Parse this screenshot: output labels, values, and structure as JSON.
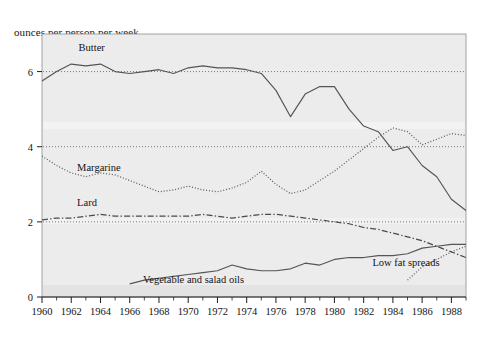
{
  "chart_data": {
    "type": "line",
    "title": "",
    "ylabel": "ounces per person per week",
    "xlabel": "",
    "ylim": [
      0,
      7
    ],
    "xlim": [
      1960,
      1989
    ],
    "yticks": [
      "0",
      "2",
      "4",
      "6"
    ],
    "ytick_values": [
      0,
      2,
      4,
      6
    ],
    "gridlines": [
      2,
      4,
      6
    ],
    "grid": "dotted horizontal gridlines at 2, 4 and 6",
    "legend": "inline labels placed next to each curve",
    "x": [
      1960,
      1961,
      1962,
      1963,
      1964,
      1965,
      1966,
      1967,
      1968,
      1969,
      1970,
      1971,
      1972,
      1973,
      1974,
      1975,
      1976,
      1977,
      1978,
      1979,
      1980,
      1981,
      1982,
      1983,
      1984,
      1985,
      1986,
      1987,
      1988,
      1989
    ],
    "xticks": [
      "1960",
      "1962",
      "1964",
      "1966",
      "1968",
      "1970",
      "1972",
      "1974",
      "1976",
      "1978",
      "1980",
      "1982",
      "1984",
      "1986",
      "1988"
    ],
    "xtick_values": [
      1960,
      1962,
      1964,
      1966,
      1968,
      1970,
      1972,
      1974,
      1976,
      1978,
      1980,
      1982,
      1984,
      1986,
      1988
    ],
    "series": [
      {
        "name": "Butter",
        "label": "Butter",
        "style": "solid",
        "color": "#555555",
        "label_x": 1962.5,
        "label_y": 6.55,
        "values": [
          5.75,
          6.0,
          6.2,
          6.15,
          6.2,
          6.0,
          5.95,
          6.0,
          6.05,
          5.95,
          6.1,
          6.15,
          6.1,
          6.1,
          6.05,
          5.95,
          5.5,
          4.8,
          5.4,
          5.6,
          5.6,
          5.0,
          4.55,
          4.4,
          3.9,
          4.0,
          3.5,
          3.2,
          2.6,
          2.3
        ]
      },
      {
        "name": "Margarine",
        "label": "Margarine",
        "style": "dotted",
        "color": "#5a5a5a",
        "label_x": 1962.4,
        "label_y": 3.35,
        "values": [
          3.75,
          3.5,
          3.3,
          3.2,
          3.3,
          3.25,
          3.1,
          2.95,
          2.8,
          2.85,
          2.95,
          2.85,
          2.8,
          2.9,
          3.05,
          3.35,
          3.0,
          2.75,
          2.85,
          3.1,
          3.35,
          3.65,
          3.95,
          4.25,
          4.5,
          4.4,
          4.05,
          4.2,
          4.35,
          4.3
        ]
      },
      {
        "name": "Lard",
        "label": "Lard",
        "style": "dashdot",
        "color": "#4a4a4a",
        "label_x": 1962.4,
        "label_y": 2.42,
        "values": [
          2.05,
          2.1,
          2.1,
          2.15,
          2.2,
          2.15,
          2.15,
          2.15,
          2.15,
          2.15,
          2.15,
          2.2,
          2.15,
          2.1,
          2.15,
          2.2,
          2.2,
          2.15,
          2.1,
          2.05,
          2.0,
          1.95,
          1.85,
          1.8,
          1.7,
          1.6,
          1.5,
          1.35,
          1.2,
          1.05
        ]
      },
      {
        "name": "Vegetable and salad oils",
        "label": "Vegetable and salad oils",
        "style": "solid",
        "color": "#555555",
        "label_x": 1966.9,
        "label_y": 0.38,
        "values": [
          null,
          null,
          null,
          null,
          null,
          null,
          0.35,
          0.45,
          0.5,
          0.55,
          0.6,
          0.65,
          0.7,
          0.85,
          0.75,
          0.7,
          0.7,
          0.75,
          0.9,
          0.85,
          1.0,
          1.05,
          1.05,
          1.1,
          1.1,
          1.15,
          1.3,
          1.35,
          1.4,
          1.4
        ]
      },
      {
        "name": "Low fat spreads",
        "label": "Low fat spreads",
        "style": "dotted",
        "color": "#5a5a5a",
        "label_x": 1982.6,
        "label_y": 0.82,
        "values": [
          null,
          null,
          null,
          null,
          null,
          null,
          null,
          null,
          null,
          null,
          null,
          null,
          null,
          null,
          null,
          null,
          null,
          null,
          null,
          null,
          null,
          null,
          null,
          null,
          null,
          0.45,
          0.8,
          1.0,
          1.2,
          1.35
        ]
      }
    ]
  }
}
